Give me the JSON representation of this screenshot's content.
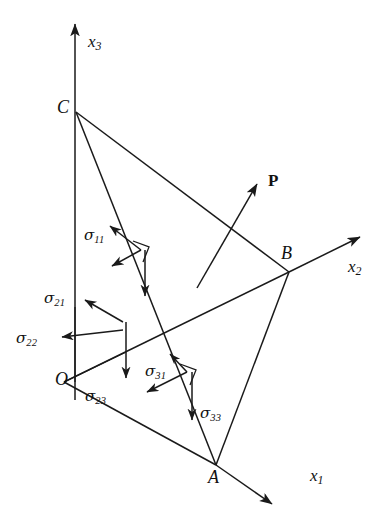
{
  "figure": {
    "background_color": "#ffffff",
    "line_color": "#1a1a1a",
    "width": 388,
    "height": 529
  },
  "axes": [
    {
      "name": "x1",
      "symbol": "x",
      "subscript": "1",
      "label": "x₁",
      "x": 310,
      "y": 467
    },
    {
      "name": "x2",
      "symbol": "x",
      "subscript": "2",
      "label": "x₂",
      "x": 348,
      "y": 258
    },
    {
      "name": "x3",
      "symbol": "x",
      "subscript": "3",
      "label": "x₃",
      "x": 88,
      "y": 33
    }
  ],
  "vertices": [
    {
      "name": "O",
      "label": "O",
      "x": 55,
      "y": 370
    },
    {
      "name": "A",
      "label": "A",
      "x": 208,
      "y": 468
    },
    {
      "name": "B",
      "label": "B",
      "x": 281,
      "y": 244
    },
    {
      "name": "C",
      "label": "C",
      "x": 57,
      "y": 98
    }
  ],
  "traction": {
    "name": "P",
    "label": "P",
    "x": 268,
    "y": 172
  },
  "stress_components": [
    {
      "name": "sigma-11",
      "symbol": "σ",
      "subscript": "11",
      "label": "σ₁₁",
      "x": 84,
      "y": 228
    },
    {
      "name": "sigma-21",
      "symbol": "σ",
      "subscript": "21",
      "label": "σ₂₁",
      "x": 44,
      "y": 291
    },
    {
      "name": "sigma-22",
      "symbol": "σ",
      "subscript": "22",
      "label": "σ₂₂",
      "x": 21,
      "y": 331
    },
    {
      "name": "sigma-23",
      "symbol": "σ",
      "subscript": "23",
      "label": "σ₂₃",
      "x": 85,
      "y": 389
    },
    {
      "name": "sigma-31",
      "symbol": "σ",
      "subscript": "31",
      "label": "σ₃₁",
      "x": 145,
      "y": 364
    },
    {
      "name": "sigma-33",
      "symbol": "σ",
      "subscript": "33",
      "label": "σ₃₃",
      "x": 200,
      "y": 406
    }
  ],
  "geometry": {
    "points": {
      "O": [
        64,
        382
      ],
      "A": [
        216,
        465
      ],
      "B": [
        289,
        272
      ],
      "C": [
        76,
        112
      ],
      "x3_tip": [
        75,
        22
      ],
      "x2_tip": [
        362,
        235
      ],
      "x1_tip": [
        274,
        506
      ],
      "P_tail": [
        197,
        288
      ],
      "P_tip": [
        259,
        181
      ]
    },
    "clusters": {
      "sigma1_node": [
        141,
        250
      ],
      "sigma2_node_top": [
        123,
        322
      ],
      "sigma2_node_bottom": [
        123,
        352
      ],
      "sigma3_node": [
        187,
        372
      ]
    }
  }
}
